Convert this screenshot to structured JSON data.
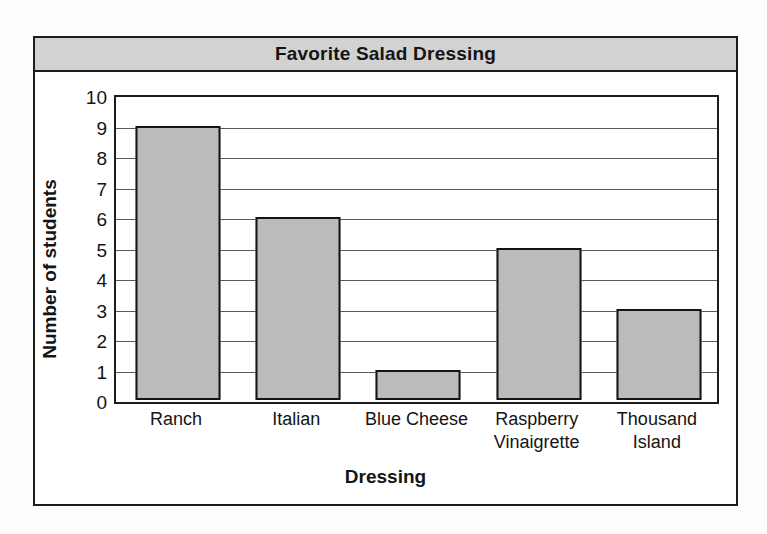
{
  "figure": {
    "title": "Favorite Salad Dressing",
    "background_color": "#ffffff",
    "frame_color": "#1c1c1c",
    "banner_color": "#d2d2d2"
  },
  "chart_data": {
    "type": "bar",
    "title": "Favorite Salad Dressing",
    "xlabel": "Dressing",
    "ylabel": "Number of students",
    "categories": [
      "Ranch",
      "Italian",
      "Blue Cheese",
      "Raspberry Vinaigrette",
      "Thousand Island"
    ],
    "category_lines": [
      [
        "Ranch"
      ],
      [
        "Italian"
      ],
      [
        "Blue Cheese"
      ],
      [
        "Raspberry",
        "Vinaigrette"
      ],
      [
        "Thousand",
        "Island"
      ]
    ],
    "values": [
      9,
      6,
      1,
      5,
      3
    ],
    "ylim": [
      0,
      10
    ],
    "ytick_step": 1,
    "yticks": [
      10,
      9,
      8,
      7,
      6,
      5,
      4,
      3,
      2,
      1,
      0
    ],
    "grid": true,
    "grid_axis": "y",
    "legend": false,
    "bar_fill_color": "#bbbbbb",
    "bar_edge_color": "#141414"
  }
}
